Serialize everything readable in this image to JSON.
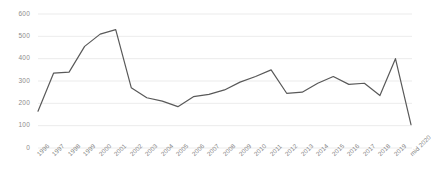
{
  "chart_data": {
    "type": "line",
    "title": "",
    "subtitle": "",
    "xlabel": "",
    "ylabel": "",
    "grid": true,
    "legend": false,
    "legend_position": "none",
    "line_color": "#595959",
    "gridline_color": "#e6e6e6",
    "background_color": "#ffffff",
    "tick_label_color": "#808080",
    "ylim": [
      0,
      600
    ],
    "yticks": [
      0,
      100,
      200,
      300,
      400,
      500,
      600
    ],
    "ytick_labels": [
      "0",
      "100",
      "200",
      "300",
      "400",
      "500",
      "600"
    ],
    "categories": [
      "1996",
      "1997",
      "1998",
      "1999",
      "2000",
      "2001",
      "2002",
      "2003",
      "2004",
      "2005",
      "2006",
      "2007",
      "2008",
      "2009",
      "2010",
      "2011",
      "2012",
      "2013",
      "2014",
      "2015",
      "2016",
      "2017",
      "2018",
      "2019",
      "mid 2020"
    ],
    "values": [
      165,
      335,
      340,
      455,
      510,
      530,
      270,
      225,
      210,
      185,
      230,
      240,
      260,
      295,
      320,
      350,
      245,
      250,
      290,
      320,
      285,
      290,
      235,
      400,
      105
    ],
    "series": [
      {
        "name": "series-1",
        "values": [
          165,
          335,
          340,
          455,
          510,
          530,
          270,
          225,
          210,
          185,
          230,
          240,
          260,
          295,
          320,
          350,
          245,
          250,
          290,
          320,
          285,
          290,
          235,
          400,
          105
        ]
      }
    ]
  }
}
